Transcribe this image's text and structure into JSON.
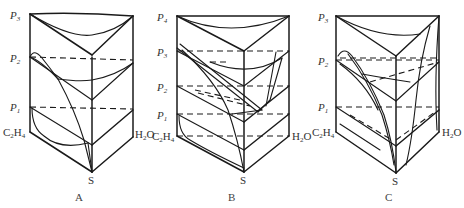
{
  "figure": {
    "panels": [
      {
        "id": "A",
        "caption": "A",
        "pressure_labels": [
          {
            "base": "P",
            "sub": "3"
          },
          {
            "base": "P",
            "sub": "2"
          },
          {
            "base": "P",
            "sub": "1"
          }
        ],
        "left_vertex": {
          "base": "C",
          "sub1": "2",
          "mid": "H",
          "sub2": "4"
        },
        "right_vertex": {
          "base": "H",
          "sub": "2",
          "rest": "O"
        },
        "bottom_vertex": "S"
      },
      {
        "id": "B",
        "caption": "B",
        "pressure_labels": [
          {
            "base": "P",
            "sub": "4"
          },
          {
            "base": "P",
            "sub": "3"
          },
          {
            "base": "P",
            "sub": "2"
          },
          {
            "base": "P",
            "sub": "1"
          }
        ],
        "left_vertex": {
          "base": "C",
          "sub1": "2",
          "mid": "H",
          "sub2": "4"
        },
        "right_vertex": {
          "base": "H",
          "sub": "2",
          "rest": "O"
        },
        "bottom_vertex": "S"
      },
      {
        "id": "C",
        "caption": "C",
        "pressure_labels": [
          {
            "base": "P",
            "sub": "3"
          },
          {
            "base": "P",
            "sub": "2"
          },
          {
            "base": "P",
            "sub": "1"
          }
        ],
        "left_vertex": {
          "base": "C",
          "sub1": "2",
          "mid": "H",
          "sub2": "4"
        },
        "right_vertex": {
          "base": "H",
          "sub": "2",
          "rest": "O"
        },
        "bottom_vertex": "S"
      }
    ]
  }
}
